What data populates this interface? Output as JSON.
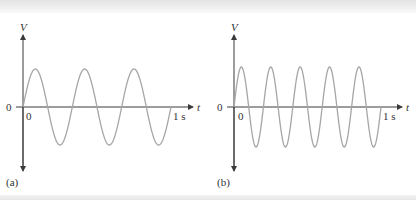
{
  "chart_data": [
    {
      "type": "line",
      "panel": "(a)",
      "title": "",
      "xlabel": "t",
      "ylabel": "V",
      "x_tick_labels": [
        "0",
        "1 s"
      ],
      "y_tick_labels": [
        "0"
      ],
      "frequency_hz": 3,
      "cycles_shown": 3,
      "waveform": "sine",
      "xlim": [
        0,
        1
      ],
      "ylim": [
        -1.8,
        1.8
      ],
      "amplitude": 1,
      "grid": false,
      "line_color": "#a6a6a6"
    },
    {
      "type": "line",
      "panel": "(b)",
      "title": "",
      "xlabel": "t",
      "ylabel": "V",
      "x_tick_labels": [
        "0",
        "1 s"
      ],
      "y_tick_labels": [
        "0"
      ],
      "frequency_hz": 5,
      "cycles_shown": 5,
      "waveform": "sine",
      "xlim": [
        0,
        1
      ],
      "ylim": [
        -1.8,
        1.8
      ],
      "amplitude": 1,
      "grid": false,
      "line_color": "#a6a6a6"
    }
  ],
  "panels": [
    {
      "label": "(a)",
      "y_axis": "V",
      "x_axis": "t",
      "origin_y": "0",
      "origin_x": "0",
      "end_x": "1 s"
    },
    {
      "label": "(b)",
      "y_axis": "V",
      "x_axis": "t",
      "origin_y": "0",
      "origin_x": "0",
      "end_x": "1 s"
    }
  ],
  "colors": {
    "axis": "#3a3a3a",
    "curve": "#a6a6a6",
    "text": "#333333"
  }
}
